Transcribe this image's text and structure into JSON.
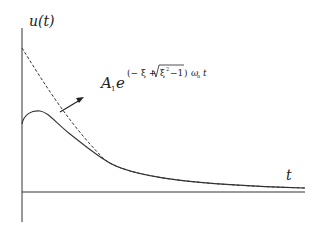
{
  "diagram": {
    "y_axis_label": "u(t)",
    "x_axis_label": "t",
    "annotation": {
      "coefficient": "A",
      "coefficient_subscript": "1",
      "base": "e",
      "exponent_open": "(− ξ + ",
      "sqrt_content": "ξ",
      "sqrt_power": "2",
      "sqrt_tail": "−1",
      "exponent_close": ")",
      "omega": "ω",
      "omega_subscript": "n",
      "time": "t"
    },
    "curves": [
      {
        "name": "envelope",
        "style": "dashed",
        "description": "exponential envelope A1·e^((−ξ+√(ξ²−1))ωn t)"
      },
      {
        "name": "response",
        "style": "solid",
        "description": "overdamped response u(t)"
      }
    ],
    "colors": {
      "line": "#333333",
      "background": "#ffffff"
    }
  }
}
